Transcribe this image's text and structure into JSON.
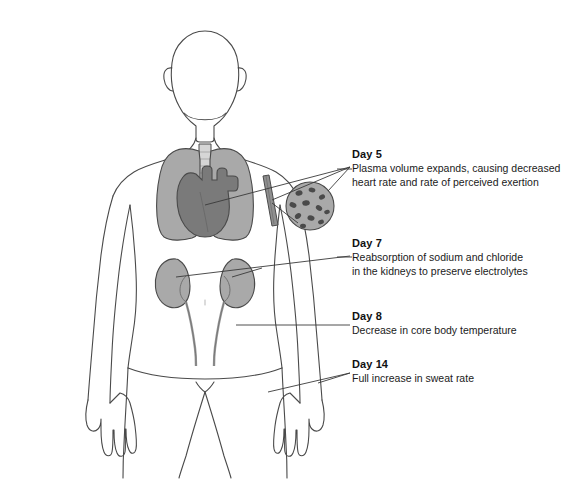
{
  "diagram": {
    "background_color": "#ffffff",
    "line_color": "#3a3a3a",
    "colors": {
      "lungs": "#a9a9a9",
      "heart": "#7a7a7a",
      "kidneys": "#a9a9a9",
      "ureter": "#9a9a9a",
      "vessel": "#8f8f8f",
      "blood_inset_fill": "#a9a9a9",
      "blood_cell": "#4a4a4a",
      "outline": "#4a4a4a",
      "leader_line": "#3a3a3a"
    },
    "body_parts": [
      "head",
      "neck",
      "trachea",
      "lungs",
      "heart",
      "kidneys",
      "ureters",
      "arm-blood-vessel",
      "torso",
      "arms",
      "hands",
      "legs"
    ],
    "blood_inset": {
      "name": "blood-vessel-cross-section",
      "cell_count": 11
    }
  },
  "callouts": [
    {
      "day": "Day 5",
      "line1": "Plasma volume expands, causing decreased",
      "line2": "heart rate and rate of perceived exertion",
      "target": "heart"
    },
    {
      "day": "Day 7",
      "line1": "Reabsorption of sodium and chloride",
      "line2": "in the kidneys to preserve electrolytes",
      "target": "kidneys"
    },
    {
      "day": "Day 8",
      "line1": "Decrease in core body temperature",
      "line2": "",
      "target": "core-body"
    },
    {
      "day": "Day 14",
      "line1": "Full increase in sweat rate",
      "line2": "",
      "target": "skin-hand"
    }
  ]
}
